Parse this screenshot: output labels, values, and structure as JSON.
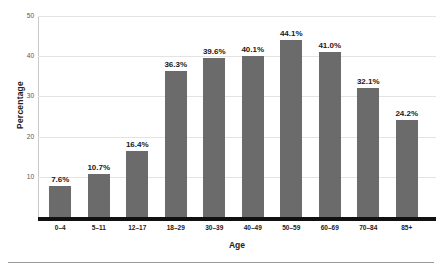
{
  "chart_data": {
    "type": "bar",
    "title": "",
    "xlabel": "Age",
    "ylabel": "Percentage",
    "categories": [
      "0–4",
      "5–11",
      "12–17",
      "18–29",
      "30–39",
      "40–49",
      "50–59",
      "60–69",
      "70–84",
      "85+"
    ],
    "values": [
      7.6,
      10.7,
      16.4,
      36.3,
      39.6,
      40.1,
      44.1,
      41.0,
      32.1,
      24.2
    ],
    "value_labels": [
      "7.6%",
      "10.7%",
      "16.4%",
      "36.3%",
      "39.6%",
      "40.1%",
      "44.1%",
      "41.0%",
      "32.1%",
      "24.2%"
    ],
    "ylim": [
      0,
      50
    ],
    "yticks": [
      10,
      20,
      30,
      40,
      50
    ],
    "ytick_labels": [
      "10",
      "20",
      "30",
      "40",
      "50"
    ],
    "grid": true,
    "legend": false,
    "legend_position": "none",
    "colors": {
      "bar": "#6b6b6b",
      "gridline": "#e3e3e3",
      "axis_line": "#c9c9c9",
      "baseline": "#111111",
      "text": "#222222",
      "tick_text": "#555555",
      "background": "#ffffff",
      "bottom_rule": "#9a9a9a"
    }
  }
}
